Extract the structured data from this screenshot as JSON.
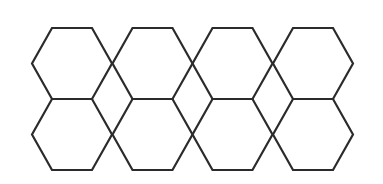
{
  "diagram": {
    "type": "hexagon-grid",
    "rows": 2,
    "columns": 4,
    "stroke_color": "#2b2b2b",
    "stroke_width": 2.2,
    "background": "#ffffff",
    "hexagon": {
      "half_width": 40,
      "half_top_edge": 20,
      "half_height": 35.5
    },
    "cells": [
      {
        "row": 0,
        "col": 0,
        "cx": 72,
        "cy": 63.5
      },
      {
        "row": 0,
        "col": 1,
        "cx": 152.5,
        "cy": 63.5
      },
      {
        "row": 0,
        "col": 2,
        "cx": 232.5,
        "cy": 63.5
      },
      {
        "row": 0,
        "col": 3,
        "cx": 313,
        "cy": 63.5
      },
      {
        "row": 1,
        "col": 0,
        "cx": 72,
        "cy": 134.5
      },
      {
        "row": 1,
        "col": 1,
        "cx": 152.5,
        "cy": 134.5
      },
      {
        "row": 1,
        "col": 2,
        "cx": 232.5,
        "cy": 134.5
      },
      {
        "row": 1,
        "col": 3,
        "cx": 313,
        "cy": 134.5
      }
    ]
  }
}
